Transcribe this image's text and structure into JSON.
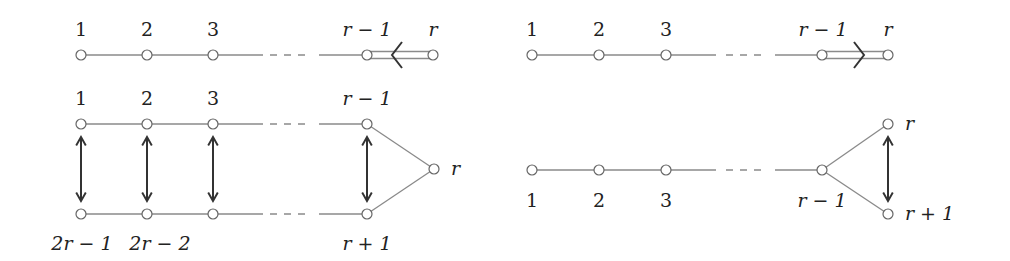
{
  "diagrams": [
    {
      "id": "top-left",
      "type": "dynkin-diagram",
      "nodes": [
        {
          "label": "1",
          "x": 81,
          "y": 55
        },
        {
          "label": "2",
          "x": 147,
          "y": 55
        },
        {
          "label": "3",
          "x": 213,
          "y": 55
        },
        {
          "label": "r − 1",
          "x": 367,
          "y": 55
        },
        {
          "label": "r",
          "x": 433,
          "y": 55
        }
      ],
      "double_edge_arrow": "left"
    },
    {
      "id": "top-right",
      "type": "dynkin-diagram",
      "nodes": [
        {
          "label": "1",
          "x": 532,
          "y": 55
        },
        {
          "label": "2",
          "x": 599,
          "y": 55
        },
        {
          "label": "3",
          "x": 666,
          "y": 55
        },
        {
          "label": "r − 1",
          "x": 822,
          "y": 55
        },
        {
          "label": "r",
          "x": 888,
          "y": 55
        }
      ],
      "double_edge_arrow": "right"
    },
    {
      "id": "bottom-left",
      "type": "folding-diagram",
      "top_nodes": [
        {
          "label": "1",
          "x": 81,
          "y": 124
        },
        {
          "label": "2",
          "x": 147,
          "y": 124
        },
        {
          "label": "3",
          "x": 213,
          "y": 124
        },
        {
          "label": "r − 1",
          "x": 367,
          "y": 124
        }
      ],
      "bottom_nodes": [
        {
          "label": "2r − 1",
          "x": 81,
          "y": 214
        },
        {
          "label": "2r − 2",
          "x": 147,
          "y": 214
        },
        {
          "label": "",
          "x": 213,
          "y": 214
        },
        {
          "label": "r + 1",
          "x": 367,
          "y": 214
        }
      ],
      "apex": {
        "label": "r",
        "x": 434,
        "y": 169
      }
    },
    {
      "id": "bottom-right",
      "type": "folding-diagram",
      "nodes": [
        {
          "label": "1",
          "x": 532,
          "y": 170
        },
        {
          "label": "2",
          "x": 599,
          "y": 170
        },
        {
          "label": "3",
          "x": 666,
          "y": 170
        },
        {
          "label": "r − 1",
          "x": 822,
          "y": 170
        }
      ],
      "fork": [
        {
          "label": "r",
          "x": 888,
          "y": 124
        },
        {
          "label": "r + 1",
          "x": 888,
          "y": 214
        }
      ]
    }
  ],
  "labels": {
    "tl": {
      "n1": "1",
      "n2": "2",
      "n3": "3",
      "nr1": "r − 1",
      "nr": "r"
    },
    "tr": {
      "n1": "1",
      "n2": "2",
      "n3": "3",
      "nr1": "r − 1",
      "nr": "r"
    },
    "bl": {
      "n1": "1",
      "n2": "2",
      "n3": "3",
      "nr1": "r − 1",
      "b1": "2r − 1",
      "b2": "2r − 2",
      "br1": "r + 1",
      "apex": "r"
    },
    "br": {
      "n1": "1",
      "n2": "2",
      "n3": "3",
      "nr1": "r − 1",
      "top": "r",
      "bottom": "r + 1"
    }
  }
}
